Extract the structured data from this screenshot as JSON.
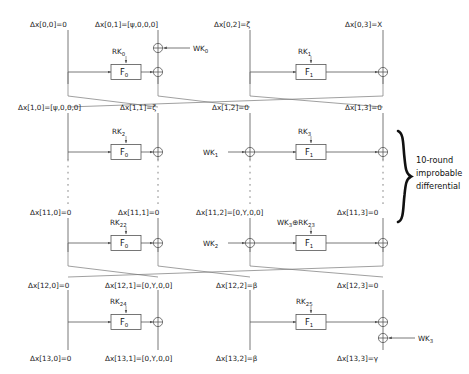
{
  "figure": {
    "annotation": {
      "line1": "10-round",
      "line2": "improbable",
      "line3": "differential"
    },
    "delta_prefix": "Δx",
    "xor_symbol": "⊕"
  },
  "rounds": [
    {
      "id": "row0",
      "labels": [
        "Δx[0,0]=0",
        "Δx[0,1]=[ψ,0,0,0]",
        "Δx[0,2]=ζ",
        "Δx[0,3]=X"
      ],
      "fbox_left": "F",
      "fbox_left_sub": "0",
      "fbox_right": "F",
      "fbox_right_sub": "1",
      "rk_left": "RK",
      "rk_left_sub": "0",
      "rk_right": "RK",
      "rk_right_sub": "1",
      "wk_left": "WK",
      "wk_left_sub": "0",
      "wk_right": "",
      "wk_right_sub": ""
    },
    {
      "id": "row1",
      "labels": [
        "Δx[1,0]=[ψ,0,0,0]",
        "Δx[1,1]=ζ",
        "Δx[1,2]=0",
        "Δx[1,3]=0"
      ],
      "fbox_left": "F",
      "fbox_left_sub": "0",
      "fbox_right": "F",
      "fbox_right_sub": "1",
      "rk_left": "RK",
      "rk_left_sub": "2",
      "rk_right": "RK",
      "rk_right_sub": "3",
      "wk_left": "",
      "wk_left_sub": "",
      "wk_right": "WK",
      "wk_right_sub": "1"
    },
    {
      "id": "row11",
      "labels": [
        "Δx[11,0]=0",
        "Δx[11,1]=0",
        "Δx[11,2]=[0,Y,0,0]",
        "Δx[11,3]=0"
      ],
      "fbox_left": "F",
      "fbox_left_sub": "0",
      "fbox_right": "F",
      "fbox_right_sub": "1",
      "rk_left": "RK",
      "rk_left_sub": "22",
      "rk_right": "WK₃⊕RK",
      "rk_right_sub": "23",
      "wk_left": "",
      "wk_left_sub": "",
      "wk_right": "WK",
      "wk_right_sub": "2"
    },
    {
      "id": "row12",
      "labels": [
        "Δx[12,0]=0",
        "Δx[12,1]=[0,Y,0,0]",
        "Δx[12,2]=β",
        "Δx[12,3]=0"
      ],
      "fbox_left": "F",
      "fbox_left_sub": "0",
      "fbox_right": "F",
      "fbox_right_sub": "1",
      "rk_left": "RK",
      "rk_left_sub": "24",
      "rk_right": "RK",
      "rk_right_sub": "25",
      "wk_left": "",
      "wk_left_sub": "",
      "wk_right": "WK",
      "wk_right_sub": "3"
    }
  ],
  "final_labels": [
    "Δx[13,0]=0",
    "Δx[13,1]=[0,Y,0,0]",
    "Δx[13,2]=β",
    "Δx[13,3]=γ"
  ],
  "rk_right_11_prefix": "WK",
  "rk_right_11_prefix_sub": "3",
  "rk_right_11_mid": "⊕RK",
  "rk_right_11_tail_sub": "23",
  "colors": {
    "wire": "#555555",
    "text": "#1a1a1a",
    "brace": "#111111",
    "background": "#ffffff"
  }
}
